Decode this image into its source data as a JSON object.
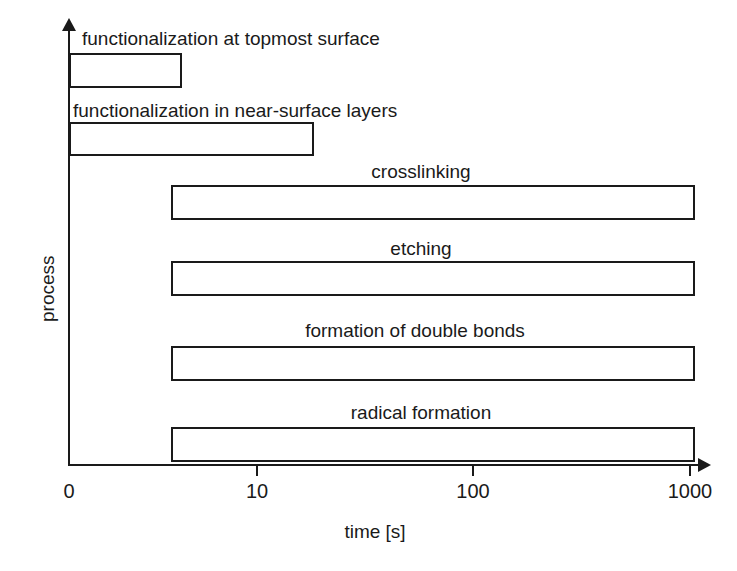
{
  "chart_data": {
    "type": "bar",
    "orientation": "horizontal",
    "title": "",
    "xlabel": "time [s]",
    "ylabel": "process",
    "xscale": "log",
    "xlim": [
      0,
      1000
    ],
    "grid": false,
    "legend": null,
    "x_tick_labels": [
      "0",
      "10",
      "100",
      "1000"
    ],
    "x_tick_values": [
      0,
      10,
      100,
      1000
    ],
    "categories": [
      "functionalization at topmost surface",
      "functionalization in near-surface layers",
      "crosslinking",
      "etching",
      "formation of double bonds",
      "radical formation"
    ],
    "bars": [
      {
        "label": "functionalization at topmost surface",
        "start": 0,
        "end": 3.3,
        "label_align": "left"
      },
      {
        "label": "functionalization in near-surface layers",
        "start": 0,
        "end": 18,
        "label_align": "left"
      },
      {
        "label": "crosslinking",
        "start": 5.5,
        "end": 1000,
        "label_align": "center"
      },
      {
        "label": "etching",
        "start": 5.5,
        "end": 1000,
        "label_align": "center"
      },
      {
        "label": "formation of double bonds",
        "start": 5.5,
        "end": 1000,
        "label_align": "center"
      },
      {
        "label": "radical formation",
        "start": 5.5,
        "end": 1000,
        "label_align": "center"
      }
    ],
    "colors": {
      "bar_fill": "#ffffff",
      "bar_stroke": "#1a1a1a",
      "axis": "#1a1a1a",
      "text": "#1a1a1a",
      "background": "#ffffff"
    }
  },
  "layout": {
    "bars_px": [
      {
        "left": 69,
        "top": 53,
        "width": 113,
        "height": 35
      },
      {
        "left": 69,
        "top": 122,
        "width": 245,
        "height": 34
      },
      {
        "left": 171,
        "top": 185,
        "width": 524,
        "height": 35
      },
      {
        "left": 171,
        "top": 261,
        "width": 524,
        "height": 35
      },
      {
        "left": 171,
        "top": 346,
        "width": 524,
        "height": 35
      },
      {
        "left": 171,
        "top": 427,
        "width": 524,
        "height": 35
      }
    ],
    "bar_labels_px": [
      {
        "left": 82,
        "top": 27,
        "centered": false
      },
      {
        "left": 73,
        "top": 99,
        "centered": false
      },
      {
        "left": 421,
        "top": 160,
        "centered": true
      },
      {
        "left": 421,
        "top": 237,
        "centered": true
      },
      {
        "left": 415,
        "top": 319,
        "centered": true
      },
      {
        "left": 421,
        "top": 401,
        "centered": true
      }
    ],
    "ticks_px": [
      69,
      257,
      473,
      690
    ],
    "x_axis_title_px": {
      "left": 375,
      "top": 520
    },
    "y_axis_title_px": {
      "left": 36,
      "top": 322
    }
  }
}
